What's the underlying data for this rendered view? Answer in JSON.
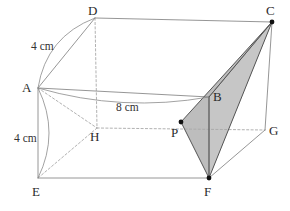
{
  "figure": {
    "width": 290,
    "height": 211,
    "background": "#ffffff",
    "colors": {
      "edge_visible": "#8a8a8a",
      "edge_hidden": "#a8a8a8",
      "edge_solid_dark": "#555555",
      "shade_fill": "#b9b9b9",
      "shade_fill_light": "#c6c6c6",
      "label_text": "#2b2b2b",
      "arc_line": "#8a8a8a",
      "point_dot": "#111111"
    }
  },
  "vertices": [
    {
      "name": "A",
      "label": "A",
      "x": 38,
      "y": 88,
      "label_x": 22,
      "label_y": 81,
      "dot": false,
      "hidden": false
    },
    {
      "name": "B",
      "label": "B",
      "x": 209,
      "y": 97,
      "label_x": 213,
      "label_y": 90,
      "dot": false,
      "hidden": false
    },
    {
      "name": "C",
      "label": "C",
      "x": 272,
      "y": 22,
      "label_x": 266,
      "label_y": 4,
      "dot": true,
      "hidden": false
    },
    {
      "name": "D",
      "label": "D",
      "x": 95,
      "y": 18,
      "label_x": 88,
      "label_y": 4,
      "dot": false,
      "hidden": false
    },
    {
      "name": "E",
      "label": "E",
      "x": 38,
      "y": 178,
      "label_x": 32,
      "label_y": 185,
      "dot": false,
      "hidden": false
    },
    {
      "name": "F",
      "label": "F",
      "x": 209,
      "y": 178,
      "label_x": 204,
      "label_y": 185,
      "dot": true,
      "hidden": false
    },
    {
      "name": "G",
      "label": "G",
      "x": 265,
      "y": 130,
      "label_x": 269,
      "label_y": 124,
      "dot": false,
      "hidden": false
    },
    {
      "name": "H",
      "label": "H",
      "x": 97,
      "y": 128,
      "label_x": 90,
      "label_y": 130,
      "dot": false,
      "hidden": true
    },
    {
      "name": "P",
      "label": "P",
      "x": 181,
      "y": 122,
      "label_x": 171,
      "label_y": 126,
      "dot": true,
      "hidden": false
    }
  ],
  "edges": {
    "visible": [
      {
        "from": "D",
        "to": "C"
      },
      {
        "from": "A",
        "to": "D"
      },
      {
        "from": "A",
        "to": "B"
      },
      {
        "from": "B",
        "to": "C"
      },
      {
        "from": "A",
        "to": "E"
      },
      {
        "from": "C",
        "to": "G"
      },
      {
        "from": "E",
        "to": "F"
      },
      {
        "from": "F",
        "to": "G"
      },
      {
        "from": "B",
        "to": "F"
      }
    ],
    "hidden": [
      {
        "from": "D",
        "to": "H"
      },
      {
        "from": "H",
        "to": "E"
      },
      {
        "from": "H",
        "to": "G"
      },
      {
        "from": "A",
        "to": "H"
      }
    ],
    "section": [
      {
        "from": "C",
        "to": "P"
      },
      {
        "from": "P",
        "to": "F"
      },
      {
        "from": "C",
        "to": "B"
      },
      {
        "from": "B",
        "to": "F"
      },
      {
        "from": "C",
        "to": "F"
      }
    ]
  },
  "shaded_regions": [
    {
      "name": "triangle-c-p-f",
      "points": "C,P,F"
    },
    {
      "name": "triangle-c-b-f",
      "points": "C,B,F"
    }
  ],
  "dimensions": [
    {
      "name": "ad-length",
      "text": "4 cm",
      "label_x": 31,
      "label_y": 41,
      "arc_from": "A",
      "arc_to": "D",
      "arc_bulge": -13
    },
    {
      "name": "ae-length",
      "text": "4 cm",
      "label_x": 14,
      "label_y": 133,
      "arc_from": "A",
      "arc_to": "E",
      "arc_bulge": -11
    },
    {
      "name": "ab-length",
      "text": "8 cm",
      "label_x": 116,
      "label_y": 102,
      "arc_from": "A",
      "arc_to": "B",
      "arc_bulge": 10
    }
  ]
}
